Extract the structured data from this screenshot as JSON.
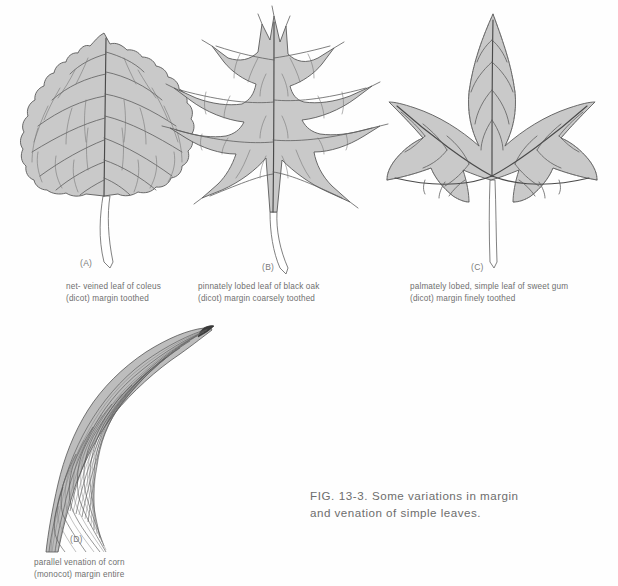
{
  "figure": {
    "label": "FIG. 13-3.",
    "text": "Some variations in margin and venation of simple leaves.",
    "caption_full": "FIG. 13-3.   Some variations in margin and venation of simple leaves."
  },
  "colors": {
    "background": "#ffffff",
    "blade_fill": "#c9c9c9",
    "blade_outline": "#5a5a5a",
    "vein_primary": "#4a4a4a",
    "vein_secondary": "#5e5e5e",
    "vein_net": "#707070",
    "corn_blade_fill": "#bdbdbd",
    "text": "#6d6d6d"
  },
  "panels": [
    {
      "letter": "(A)",
      "subject": "coleus leaf",
      "venation": "net-veined",
      "plant_group": "dicot",
      "margin": "toothed",
      "caption_line1": "net- veined leaf of coleus",
      "caption_line2": "(dicot) margin toothed"
    },
    {
      "letter": "(B)",
      "subject": "black oak leaf",
      "venation": "pinnately lobed",
      "plant_group": "dicot",
      "margin": "coarsely toothed",
      "caption_line1": "pinnately lobed leaf of black oak",
      "caption_line2": "(dicot) margin coarsely toothed"
    },
    {
      "letter": "(C)",
      "subject": "sweet gum leaf",
      "venation": "palmately lobed, simple",
      "plant_group": "dicot",
      "margin": "finely toothed",
      "caption_line1": "palmately lobed, simple leaf of sweet gum",
      "caption_line2": "(dicot) margin finely toothed"
    },
    {
      "letter": "(D)",
      "subject": "corn leaf",
      "venation": "parallel venation",
      "plant_group": "monocot",
      "margin": "entire",
      "caption_line1": "parallel venation of corn",
      "caption_line2": "(monocot) margin entire"
    }
  ]
}
